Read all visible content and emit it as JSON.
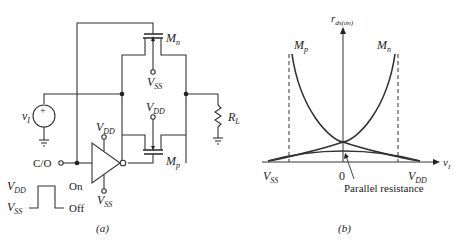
{
  "panel_a": {
    "caption": "(a)",
    "transistor_n": {
      "label": "M",
      "sub": "n"
    },
    "transistor_p": {
      "label": "M",
      "sub": "p"
    },
    "vss_top": {
      "label": "V",
      "sub": "SS"
    },
    "vdd_mid": {
      "label": "V",
      "sub": "DD"
    },
    "source": {
      "label": "v",
      "sub": "I",
      "sign": "+"
    },
    "load": {
      "label": "R",
      "sub": "L"
    },
    "control": {
      "label": "C/O"
    },
    "inverter_vdd": {
      "label": "V",
      "sub": "DD"
    },
    "inverter_vss": {
      "label": "V",
      "sub": "SS"
    },
    "pulse": {
      "high_label": {
        "label": "V",
        "sub": "DD"
      },
      "low_label": {
        "label": "V",
        "sub": "SS"
      },
      "on_label": "On",
      "off_label": "Off"
    }
  },
  "panel_b": {
    "caption": "(b)",
    "y_axis": {
      "label": "r",
      "sub": "ds(on)"
    },
    "x_axis": {
      "label": "v",
      "sub": "I"
    },
    "curve_p": {
      "label": "M",
      "sub": "p"
    },
    "curve_n": {
      "label": "M",
      "sub": "n"
    },
    "tick_left": {
      "label": "V",
      "sub": "SS"
    },
    "tick_zero": "0",
    "tick_right": {
      "label": "V",
      "sub": "DD"
    },
    "annotation": "Parallel resistance"
  }
}
